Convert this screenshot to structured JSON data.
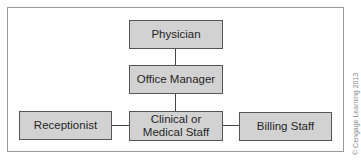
{
  "diagram": {
    "type": "org-chart",
    "nodes": {
      "physician": "Physician",
      "office_manager": "Office Manager",
      "clinical_line1": "Clinical or",
      "clinical_line2": "Medical Staff",
      "receptionist": "Receptionist",
      "billing_staff": "Billing Staff"
    },
    "edges": [
      [
        "Physician",
        "Office Manager"
      ],
      [
        "Office Manager",
        "Clinical or Medical Staff"
      ],
      [
        "Receptionist",
        "Clinical or Medical Staff"
      ],
      [
        "Clinical or Medical Staff",
        "Billing Staff"
      ]
    ],
    "colors": {
      "box_fill": "#d2d2d2",
      "box_border": "#555555",
      "connector": "#444444",
      "frame": "#9a9a9a"
    }
  },
  "copyright": "© Cengage Learning 2013"
}
